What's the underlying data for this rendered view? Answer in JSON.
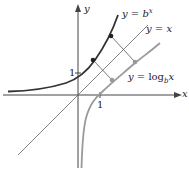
{
  "diagram": {
    "axes": {
      "x_label": "x",
      "y_label": "y",
      "x_tick": "1",
      "y_tick": "1"
    },
    "curves": [
      {
        "name": "exponential",
        "label": "y = b^x",
        "label_main": "y = b",
        "label_sup": "x",
        "color": "#333333"
      },
      {
        "name": "identity",
        "label": "y = x",
        "color": "#555555"
      },
      {
        "name": "logarithm",
        "label": "y = log_b x",
        "label_main": "y = log",
        "label_sub": "b",
        "label_tail": "x",
        "color": "#999999"
      }
    ],
    "colors": {
      "exp": "#333333",
      "log": "#9a9a9a",
      "axis": "#444444",
      "line": "#555555"
    }
  }
}
